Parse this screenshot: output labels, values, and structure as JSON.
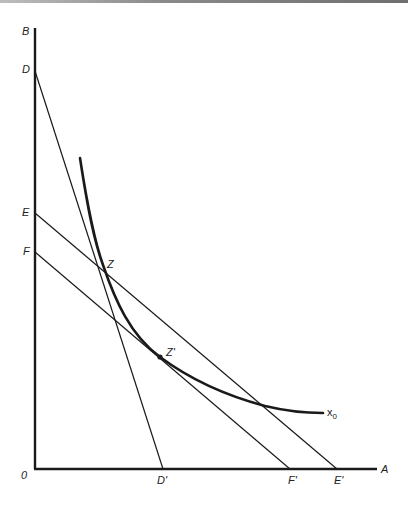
{
  "diagram": {
    "type": "isoquant-isocost",
    "axes": {
      "vertical_label": "B",
      "horizontal_label": "A",
      "origin_label": "0"
    },
    "points": {
      "D": "D",
      "E": "E",
      "F": "F",
      "D_prime": "D'",
      "E_prime": "E'",
      "F_prime": "F'",
      "Z": "Z",
      "Z_prime": "Z'"
    },
    "curve_label_base": "x",
    "curve_label_sub": "0",
    "lines": [
      {
        "name": "DD'",
        "from": "D",
        "to": "D'"
      },
      {
        "name": "EE'",
        "from": "E",
        "to": "E'"
      },
      {
        "name": "FF'",
        "from": "F",
        "to": "F'"
      }
    ],
    "colors": {
      "ink": "#1a1a1a",
      "background": "#ffffff"
    }
  }
}
